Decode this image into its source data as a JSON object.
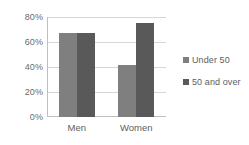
{
  "chart_data": {
    "type": "bar",
    "title": "",
    "subtitle": "",
    "xlabel": "",
    "ylabel": "",
    "categories": [
      "Men",
      "Women"
    ],
    "series": [
      {
        "name": "Under 50",
        "values": [
          67,
          42
        ],
        "color": "#7f7f7f"
      },
      {
        "name": "50 and over",
        "values": [
          67,
          75
        ],
        "color": "#595959"
      }
    ],
    "ylim": [
      0,
      80
    ],
    "ytick_values": [
      0,
      20,
      40,
      60,
      80
    ],
    "ytick_labels": [
      "0%",
      "20%",
      "40%",
      "60%",
      "80%"
    ],
    "grid": true,
    "legend_position": "right"
  },
  "legend": {
    "items": [
      {
        "label": "Under 50",
        "swatch": "legend-swatch-under-50"
      },
      {
        "label": "50 and over",
        "swatch": "legend-swatch-50-and-over"
      }
    ]
  },
  "colors": {
    "series_under_50": "#7f7f7f",
    "series_50_and_over": "#595959",
    "gridline": "#d6d6d6",
    "axis": "#bfbfbf",
    "tick_text": "#6b6b6b",
    "background": "#ffffff"
  }
}
